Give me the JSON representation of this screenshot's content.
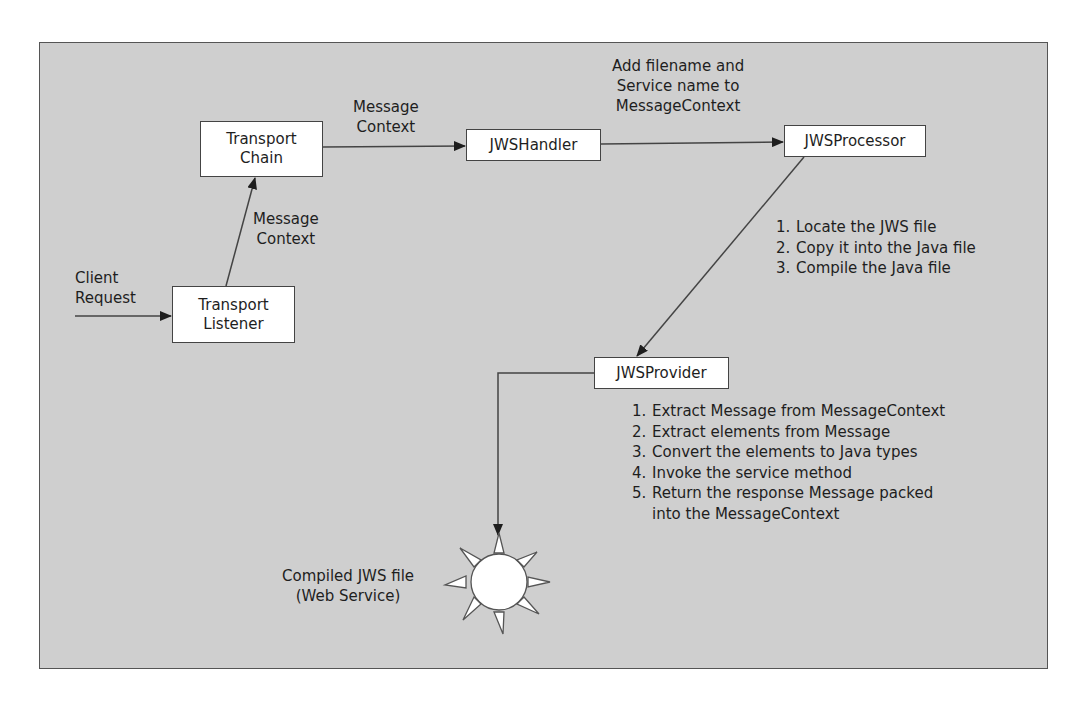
{
  "diagram": {
    "type": "flowchart",
    "background_color": "#cfcfcf",
    "node_fill": "#ffffff",
    "line_color": "#444444",
    "nodes": {
      "transport_listener": {
        "line1": "Transport",
        "line2": "Listener"
      },
      "transport_chain": {
        "line1": "Transport",
        "line2": "Chain"
      },
      "jws_handler": {
        "label": "JWSHandler"
      },
      "jws_processor": {
        "label": "JWSProcessor"
      },
      "jws_provider": {
        "label": "JWSProvider"
      },
      "compiled_jws": {
        "line1": "Compiled JWS file",
        "line2": "(Web Service)",
        "icon": "sun-icon"
      }
    },
    "edge_labels": {
      "client_request": {
        "line1": "Client",
        "line2": "Request"
      },
      "listener_to_chain": {
        "line1": "Message",
        "line2": "Context"
      },
      "chain_to_handler": {
        "line1": "Message",
        "line2": "Context"
      },
      "handler_to_processor": {
        "line1": "Add filename and",
        "line2": "Service name to",
        "line3": "MessageContext"
      }
    },
    "processor_steps": [
      {
        "num": "1.",
        "text": "Locate the JWS file"
      },
      {
        "num": "2.",
        "text": "Copy it into the Java file"
      },
      {
        "num": "3.",
        "text": "Compile the Java file"
      }
    ],
    "provider_steps": [
      {
        "num": "1.",
        "text": "Extract Message from MessageContext"
      },
      {
        "num": "2.",
        "text": "Extract elements from Message"
      },
      {
        "num": "3.",
        "text": "Convert the elements to Java types"
      },
      {
        "num": "4.",
        "text": "Invoke the service method"
      },
      {
        "num": "5.",
        "text": "Return the response Message packed",
        "cont": "into the MessageContext"
      }
    ],
    "edges": [
      {
        "from": "client",
        "to": "transport_listener"
      },
      {
        "from": "transport_listener",
        "to": "transport_chain"
      },
      {
        "from": "transport_chain",
        "to": "jws_handler"
      },
      {
        "from": "jws_handler",
        "to": "jws_processor"
      },
      {
        "from": "jws_processor",
        "to": "jws_provider"
      },
      {
        "from": "jws_provider",
        "to": "compiled_jws"
      }
    ]
  }
}
